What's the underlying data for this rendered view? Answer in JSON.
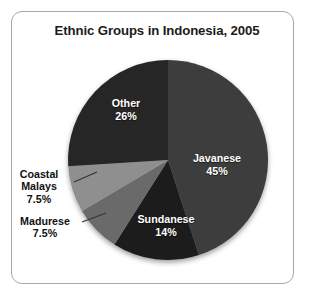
{
  "chart_data": {
    "type": "pie",
    "title": "Ethnic Groups in Indonesia, 2005",
    "xlabel": "",
    "ylabel": "",
    "legend": "none",
    "grid": false,
    "value_unit": "percent",
    "categories": [
      "Javanese",
      "Sundanese",
      "Madurese",
      "Coastal Malays",
      "Other"
    ],
    "values": [
      45,
      14,
      7.5,
      7.5,
      26
    ],
    "slices": [
      {
        "name": "Javanese",
        "label": "Javanese",
        "value": 45,
        "value_text": "45%",
        "color": "#3c3c3c",
        "label_placement": "inside",
        "label_color": "#ffffff",
        "start_angle_deg": 0,
        "end_angle_deg": 162
      },
      {
        "name": "Sundanese",
        "label": "Sundanese",
        "value": 14,
        "value_text": "14%",
        "color": "#1e1e1e",
        "label_placement": "inside",
        "label_color": "#ffffff",
        "start_angle_deg": 162,
        "end_angle_deg": 212.4
      },
      {
        "name": "Madurese",
        "label": "Madurese",
        "value": 7.5,
        "value_text": "7.5%",
        "color": "#6a6a6a",
        "label_placement": "outside",
        "label_color": "#111111",
        "start_angle_deg": 212.4,
        "end_angle_deg": 239.4
      },
      {
        "name": "Coastal Malays",
        "label": "Coastal Malays",
        "label_line1": "Coastal",
        "label_line2": "Malays",
        "value": 7.5,
        "value_text": "7.5%",
        "color": "#8f8f8f",
        "label_placement": "outside",
        "label_color": "#111111",
        "start_angle_deg": 239.4,
        "end_angle_deg": 266.4
      },
      {
        "name": "Other",
        "label": "Other",
        "value": 26,
        "value_text": "26%",
        "color": "#272727",
        "label_placement": "inside",
        "label_color": "#ffffff",
        "start_angle_deg": 266.4,
        "end_angle_deg": 360
      }
    ]
  },
  "figure": {
    "background_color": "#ffffff",
    "frame_color": "#a8a8a8",
    "title_color": "#1b1b1b"
  }
}
